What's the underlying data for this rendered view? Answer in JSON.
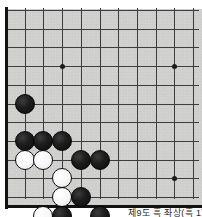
{
  "figure": {
    "kind": "go-board-diagram",
    "caption": "제9도 흑 좌상(흑 1)",
    "board": {
      "background_color": "#d3d3d2",
      "line_color": "#3c3c3c",
      "edge_color": "#121212",
      "columns": 11,
      "rows": 11,
      "spacing_px": 18.7,
      "origin_x": 6,
      "origin_y": 10
    },
    "star_points": [
      {
        "name": "hoshi-upper-left",
        "col": 3,
        "row": 3
      },
      {
        "name": "hoshi-upper-right",
        "col": 9,
        "row": 3
      },
      {
        "name": "hoshi-lower-right",
        "col": 9,
        "row": 9
      }
    ],
    "stones": [
      {
        "color": "black",
        "col": 1,
        "row": 5,
        "label": "black-stone-b5"
      },
      {
        "color": "black",
        "col": 1,
        "row": 7,
        "label": "black-stone-b7"
      },
      {
        "color": "black",
        "col": 2,
        "row": 7,
        "label": "black-stone-c7"
      },
      {
        "color": "black",
        "col": 3,
        "row": 7,
        "label": "black-stone-d7"
      },
      {
        "color": "white",
        "col": 1,
        "row": 8,
        "label": "white-stone-b8"
      },
      {
        "color": "white",
        "col": 2,
        "row": 8,
        "label": "white-stone-c8"
      },
      {
        "color": "black",
        "col": 4,
        "row": 8,
        "label": "black-stone-e8"
      },
      {
        "color": "black",
        "col": 5,
        "row": 8,
        "label": "black-stone-f8"
      },
      {
        "color": "white",
        "col": 3,
        "row": 9,
        "label": "white-stone-d9"
      },
      {
        "color": "white",
        "col": 3,
        "row": 10,
        "label": "white-stone-d10"
      },
      {
        "color": "black",
        "col": 4,
        "row": 10,
        "label": "black-stone-e10"
      },
      {
        "color": "white",
        "col": 2,
        "row": 11,
        "label": "white-stone-c11"
      },
      {
        "color": "black",
        "col": 3,
        "row": 11,
        "label": "black-stone-d11"
      },
      {
        "color": "black",
        "col": 5,
        "row": 11,
        "label": "black-stone-f11"
      },
      {
        "color": "black",
        "col": 4,
        "row": 12,
        "label": "black-stone-e12"
      }
    ],
    "counts": {
      "black_stones": "10",
      "white_stones": "5"
    }
  }
}
